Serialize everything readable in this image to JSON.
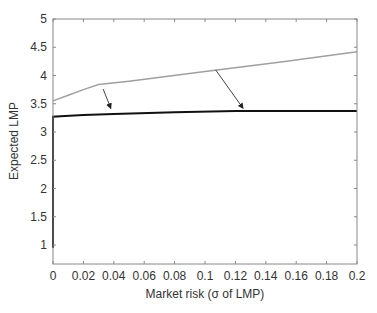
{
  "chart_data": {
    "type": "line",
    "title": "",
    "xlabel": "Market risk (σ of LMP)",
    "ylabel": "Expected LMP",
    "xlim": [
      0,
      0.2
    ],
    "ylim": [
      0.66,
      5
    ],
    "grid": false,
    "legend": null,
    "xticks": [
      "0",
      "0.02",
      "0.04",
      "0.06",
      "0.08",
      "0.1",
      "0.12",
      "0.14",
      "0.16",
      "0.18",
      "0.2"
    ],
    "yticks": [
      "1",
      "1.5",
      "2",
      "2.5",
      "3",
      "3.5",
      "4",
      "4.5",
      "5"
    ],
    "series": [
      {
        "name": "upper (gray)",
        "color": "#a0a0a0",
        "x": [
          0,
          0.01,
          0.02,
          0.03,
          0.05,
          0.1,
          0.15,
          0.2
        ],
        "y": [
          3.55,
          3.65,
          3.75,
          3.84,
          3.9,
          4.07,
          4.24,
          4.42
        ]
      },
      {
        "name": "lower (black)",
        "color": "#111111",
        "x": [
          0,
          0,
          0.005,
          0.02,
          0.04,
          0.08,
          0.12,
          0.16,
          0.2
        ],
        "y": [
          0.95,
          3.27,
          3.28,
          3.3,
          3.32,
          3.35,
          3.37,
          3.37,
          3.37
        ]
      }
    ],
    "annotations": [
      {
        "type": "arrow",
        "from": [
          0.033,
          3.76
        ],
        "to": [
          0.038,
          3.42
        ]
      },
      {
        "type": "arrow",
        "from": [
          0.107,
          4.1
        ],
        "to": [
          0.125,
          3.42
        ]
      }
    ]
  }
}
